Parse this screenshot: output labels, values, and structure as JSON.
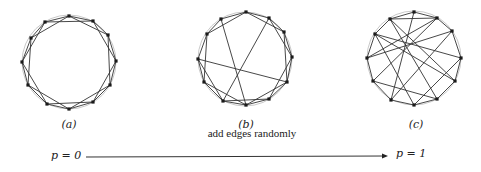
{
  "figure": {
    "colors": {
      "edge": "#333333",
      "node": "#1a1a1a",
      "guide_circle": "#bbbbbb",
      "text": "#222222"
    },
    "panels": [
      {
        "id": "a",
        "label": "(a)",
        "label_pos": [
          69,
          126
        ],
        "center": [
          69,
          62
        ],
        "radius": 47,
        "nodes": [
          [
            69,
            16
          ],
          [
            93,
            21
          ],
          [
            108,
            35
          ],
          [
            116,
            61
          ],
          [
            110,
            85
          ],
          [
            93,
            102
          ],
          [
            69,
            109
          ],
          [
            47,
            104
          ],
          [
            28,
            85
          ],
          [
            22,
            62
          ],
          [
            31,
            38
          ],
          [
            45,
            22
          ]
        ],
        "edges": [
          [
            0,
            1
          ],
          [
            1,
            2
          ],
          [
            2,
            3
          ],
          [
            3,
            4
          ],
          [
            4,
            5
          ],
          [
            5,
            6
          ],
          [
            6,
            7
          ],
          [
            7,
            8
          ],
          [
            8,
            9
          ],
          [
            9,
            10
          ],
          [
            10,
            11
          ],
          [
            11,
            0
          ],
          [
            0,
            2
          ],
          [
            1,
            3
          ],
          [
            2,
            4
          ],
          [
            3,
            5
          ],
          [
            4,
            6
          ],
          [
            5,
            7
          ],
          [
            6,
            8
          ],
          [
            7,
            9
          ],
          [
            8,
            10
          ],
          [
            9,
            11
          ],
          [
            10,
            0
          ],
          [
            11,
            1
          ]
        ]
      },
      {
        "id": "b",
        "label": "(b)",
        "label_pos": [
          246,
          126
        ],
        "center": [
          245,
          59
        ],
        "radius": 47,
        "nodes": [
          [
            246,
            12
          ],
          [
            269,
            18
          ],
          [
            284,
            32
          ],
          [
            292,
            57
          ],
          [
            287,
            82
          ],
          [
            269,
            99
          ],
          [
            246,
            105
          ],
          [
            223,
            101
          ],
          [
            204,
            82
          ],
          [
            198,
            59
          ],
          [
            207,
            34
          ],
          [
            221,
            19
          ]
        ],
        "edges": [
          [
            0,
            1
          ],
          [
            1,
            2
          ],
          [
            2,
            3
          ],
          [
            3,
            4
          ],
          [
            4,
            5
          ],
          [
            5,
            6
          ],
          [
            6,
            7
          ],
          [
            7,
            8
          ],
          [
            8,
            9
          ],
          [
            9,
            10
          ],
          [
            10,
            11
          ],
          [
            11,
            0
          ],
          [
            0,
            2
          ],
          [
            1,
            3
          ],
          [
            2,
            4
          ],
          [
            3,
            5
          ],
          [
            4,
            6
          ],
          [
            5,
            7
          ],
          [
            6,
            8
          ],
          [
            7,
            9
          ],
          [
            8,
            10
          ],
          [
            10,
            0
          ],
          [
            9,
            4
          ],
          [
            11,
            6
          ],
          [
            1,
            7
          ]
        ]
      },
      {
        "id": "c",
        "label": "(c)",
        "label_pos": [
          416,
          126
        ],
        "center": [
          414,
          58
        ],
        "radius": 47,
        "nodes": [
          [
            414,
            12
          ],
          [
            437,
            18
          ],
          [
            452,
            31
          ],
          [
            461,
            58
          ],
          [
            455,
            81
          ],
          [
            437,
            99
          ],
          [
            414,
            105
          ],
          [
            391,
            100
          ],
          [
            373,
            81
          ],
          [
            367,
            58
          ],
          [
            375,
            34
          ],
          [
            390,
            19
          ]
        ],
        "edges": [
          [
            0,
            1
          ],
          [
            1,
            2
          ],
          [
            2,
            3
          ],
          [
            3,
            4
          ],
          [
            4,
            5
          ],
          [
            5,
            6
          ],
          [
            6,
            7
          ],
          [
            7,
            8
          ],
          [
            8,
            9
          ],
          [
            9,
            10
          ],
          [
            10,
            11
          ],
          [
            11,
            0
          ],
          [
            11,
            1
          ],
          [
            10,
            3
          ],
          [
            11,
            5
          ],
          [
            1,
            8
          ],
          [
            0,
            7
          ],
          [
            2,
            9
          ],
          [
            10,
            4
          ],
          [
            3,
            6
          ],
          [
            8,
            5
          ],
          [
            9,
            1
          ],
          [
            2,
            7
          ],
          [
            4,
            11
          ],
          [
            6,
            10
          ]
        ]
      }
    ],
    "arrow": {
      "caption": "add edges randomly",
      "caption_pos": [
        252,
        136
      ],
      "start": [
        86,
        157
      ],
      "end": [
        388,
        156
      ],
      "left_label": "p = 0",
      "left_label_pos": [
        51,
        149
      ],
      "right_label": "p = 1",
      "right_label_pos": [
        396,
        147
      ]
    }
  }
}
